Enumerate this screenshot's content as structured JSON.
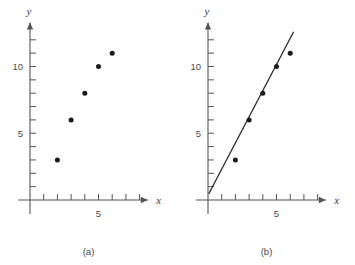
{
  "figure": {
    "panels": [
      {
        "id": "a",
        "caption": "(a)",
        "chart_data": {
          "type": "scatter",
          "title": "",
          "xlabel": "x",
          "ylabel": "y",
          "x": [
            2,
            3,
            4,
            5,
            6
          ],
          "y": [
            3,
            6,
            8,
            10,
            11
          ],
          "xlim": [
            0,
            8
          ],
          "ylim": [
            0,
            13
          ],
          "x_ticks": [
            1,
            2,
            3,
            4,
            5,
            6,
            7,
            8
          ],
          "x_tick_labels": [
            "",
            "",
            "",
            "",
            "5",
            "",
            "",
            ""
          ],
          "y_ticks": [
            1,
            2,
            3,
            4,
            5,
            6,
            7,
            8,
            9,
            10,
            11,
            12
          ],
          "y_tick_labels": [
            "",
            "",
            "",
            "",
            "5",
            "",
            "",
            "",
            "",
            "10",
            "",
            ""
          ],
          "grid": false,
          "legend": "none",
          "has_fit_line": false,
          "axis_arrows": true
        }
      },
      {
        "id": "b",
        "caption": "(b)",
        "chart_data": {
          "type": "scatter",
          "title": "",
          "xlabel": "x",
          "ylabel": "y",
          "x": [
            2,
            3,
            4,
            5,
            6
          ],
          "y": [
            3,
            6,
            8,
            10,
            11
          ],
          "xlim": [
            0,
            8
          ],
          "ylim": [
            0,
            13
          ],
          "x_ticks": [
            1,
            2,
            3,
            4,
            5,
            6,
            7,
            8
          ],
          "x_tick_labels": [
            "",
            "",
            "",
            "",
            "5",
            "",
            "",
            ""
          ],
          "y_ticks": [
            1,
            2,
            3,
            4,
            5,
            6,
            7,
            8,
            9,
            10,
            11,
            12
          ],
          "y_tick_labels": [
            "",
            "",
            "",
            "",
            "5",
            "",
            "",
            "",
            "",
            "10",
            "",
            ""
          ],
          "grid": false,
          "legend": "none",
          "has_fit_line": true,
          "fit_line": {
            "x_start": 0.05,
            "y_start": 0.45,
            "x_end": 6.25,
            "y_end": 12.6,
            "slope": 1.96,
            "intercept": 0.35
          },
          "axis_arrows": true
        }
      }
    ],
    "colors": {
      "axis": "#555555",
      "point": "#1a1a1a",
      "line": "#2a2a2a",
      "text": "#4a4a4a",
      "background": "#ffffff"
    }
  }
}
